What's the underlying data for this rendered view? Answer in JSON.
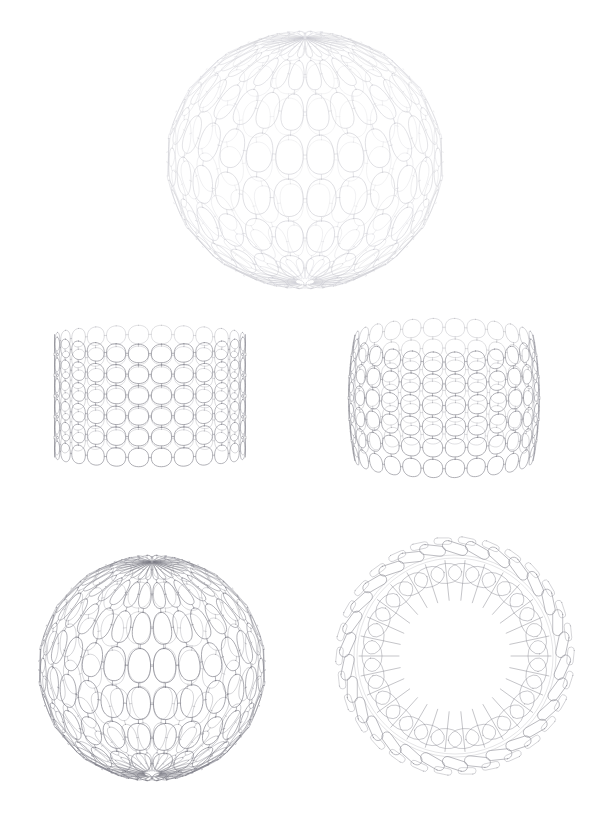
{
  "document": {
    "kind": "technical-line-drawing",
    "title": "Modular lattice shell — five orthographic / perspective studies",
    "page_width": 592,
    "page_height": 813,
    "background_color": "#ffffff",
    "ink_color": "#3a3a42",
    "medium": "vector line drawing, no fill",
    "visible_text": []
  },
  "palette": {
    "background": "#ffffff",
    "ink_dark": "#4a4a52",
    "ink_mid": "#8a8a93",
    "ink_light": "#c9c9d0",
    "ink_faint": "#e0e0e6"
  },
  "figures": [
    {
      "id": "fig-dome-top",
      "name": "hemispherical-dome-perspective",
      "caption": "",
      "position": "top-center",
      "bbox": [
        165,
        28,
        278,
        244
      ],
      "center": [
        302,
        150
      ],
      "view": "three-quarter perspective, viewed slightly from above",
      "form": "hemispherical bowl / dome",
      "stroke_color": "#c9c9d0",
      "stroke_width": 0.6,
      "radius_x": 139,
      "radius_y": 122,
      "rows": 9,
      "columns": 26,
      "cell_shape": "rounded-square panel",
      "open_top": true
    },
    {
      "id": "fig-barrel-left",
      "name": "cylindrical-barrel-elevation-a",
      "caption": "",
      "position": "middle-left",
      "bbox": [
        36,
        318,
        228,
        155
      ],
      "center": [
        150,
        396
      ],
      "view": "straight-on elevation",
      "form": "barrelled cylinder / drum",
      "stroke_color": "#8a8a93",
      "stroke_width": 0.7,
      "radius_x": 96,
      "radius_y": 78,
      "rows": 6,
      "columns": 26,
      "cell_shape": "rounded-square panel",
      "open_top": true
    },
    {
      "id": "fig-barrel-right",
      "name": "cylindrical-barrel-elevation-b",
      "caption": "",
      "position": "middle-right",
      "bbox": [
        330,
        318,
        228,
        160
      ],
      "center": [
        444,
        398
      ],
      "view": "elevation, viewed slightly from above",
      "form": "barrelled cylinder / drum",
      "stroke_color": "#8a8a93",
      "stroke_width": 0.7,
      "radius_x": 96,
      "radius_y": 80,
      "rows": 6,
      "columns": 26,
      "cell_shape": "rounded-square panel",
      "open_top": true
    },
    {
      "id": "fig-bowl-bottom",
      "name": "deep-bowl-perspective",
      "caption": "",
      "position": "bottom-left",
      "bbox": [
        38,
        562,
        228,
        216
      ],
      "center": [
        152,
        668
      ],
      "view": "three-quarter perspective, viewed from above",
      "form": "deep hemispherical bowl",
      "stroke_color": "#7b7b85",
      "stroke_width": 0.7,
      "radius_x": 114,
      "radius_y": 106,
      "rows": 9,
      "columns": 26,
      "cell_shape": "rounded-square panel",
      "open_top": true
    },
    {
      "id": "fig-ring-plan",
      "name": "ring-plan-view",
      "caption": "",
      "position": "bottom-right",
      "bbox": [
        335,
        537,
        240,
        238
      ],
      "center": [
        455,
        656
      ],
      "view": "plan / top view looking down the axis",
      "form": "annular ring of panels with radial spokes",
      "stroke_color": "#8a8a93",
      "stroke_width": 0.7,
      "outer_radius": 119,
      "inner_band_radius": 92,
      "aperture_radius": 62,
      "segments": 30,
      "spoke_count": 30,
      "cell_shape": "ellipse / capsule panel",
      "open_top": true
    }
  ],
  "geometry_notes": {
    "module": "rounded-square (superellipse) panel",
    "joint": "short straight connector link between adjacent panels",
    "assembly": "panels tiled on a surface of revolution, edge-connected"
  }
}
